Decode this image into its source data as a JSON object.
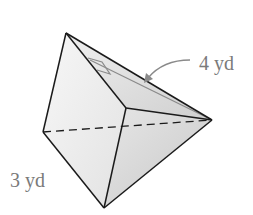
{
  "figure": {
    "type": "triangular pyramid",
    "labels": {
      "slant_height": "4 yd",
      "base_edge": "3 yd"
    },
    "colors": {
      "edge": "#1a1a1a",
      "annotation": "#8a8a8a",
      "face_light": "#f2f2f2",
      "face_mid": "#e0e0e0",
      "face_dark": "#d0d0d0"
    }
  }
}
